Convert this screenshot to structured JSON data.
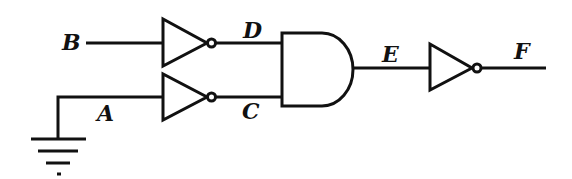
{
  "diagram": {
    "type": "logic-circuit",
    "colors": {
      "stroke": "#111111",
      "background": "#ffffff"
    },
    "labels": {
      "B": "B",
      "A": "A",
      "C": "C",
      "D": "D",
      "E": "E",
      "F": "F"
    },
    "components": [
      {
        "id": "not-1",
        "kind": "NOT gate",
        "input": "B",
        "output": "D"
      },
      {
        "id": "not-2",
        "kind": "NOT gate",
        "input": "A",
        "output": "C"
      },
      {
        "id": "and-1",
        "kind": "AND gate",
        "inputs": [
          "D",
          "C"
        ],
        "output": "E"
      },
      {
        "id": "not-3",
        "kind": "NOT gate",
        "input": "E",
        "output": "F"
      },
      {
        "id": "ground",
        "kind": "ground symbol",
        "connected_to": "A"
      }
    ]
  }
}
